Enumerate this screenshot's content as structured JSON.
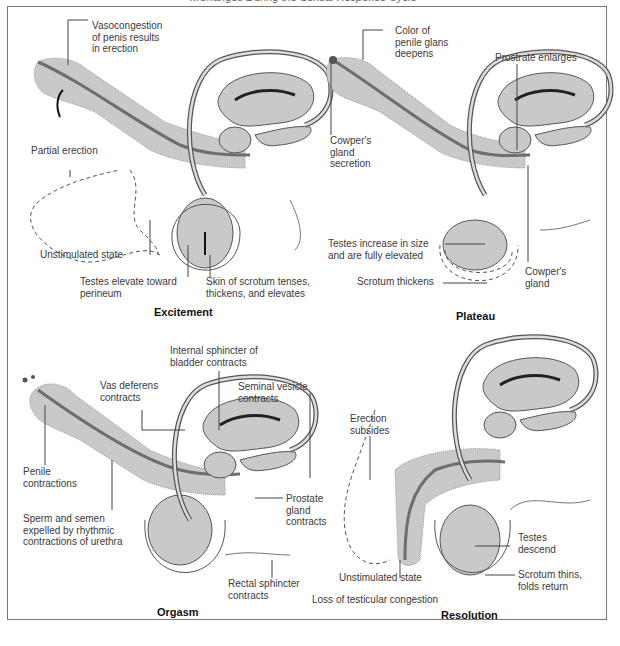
{
  "header": {
    "caption": "...Changes During the Sexual Response Cycle"
  },
  "panels": {
    "excitement": {
      "title": "Excitement",
      "labels": {
        "vasocongestion": "Vasocongestion\nof penis results\nin erection",
        "partial_erection": "Partial erection",
        "unstimulated": "Unstimulated state",
        "testes_elevate": "Testes elevate toward\nperineum",
        "scrotum_tenses": "Skin of scrotum tenses,\nthickens, and elevates"
      }
    },
    "plateau": {
      "title": "Plateau",
      "labels": {
        "glans_color": "Color of\npenile glans\ndeepens",
        "prostate_enlarges": "Prostrate enlarges",
        "cowpers_secretion": "Cowper's\ngland\nsecretion",
        "testes_increase": "Testes increase in size\nand are fully elevated",
        "scrotum_thickens": "Scrotum thickens",
        "cowpers_gland": "Cowper's\ngland"
      }
    },
    "orgasm": {
      "title": "Orgasm",
      "labels": {
        "internal_sphincter": "Internal sphincter of\nbladder contracts",
        "vas_deferens": "Vas deferens\ncontracts",
        "seminal_vesicle": "Seminal vesicle\ncontracts",
        "penile_contractions": "Penile\ncontractions",
        "prostate_contracts": "Prostate\ngland\ncontracts",
        "sperm_semen": "Sperm and semen\nexpelled by rhythmic\ncontractions of urethra",
        "rectal_sphincter": "Rectal sphincter\ncontracts"
      }
    },
    "resolution": {
      "title": "Resolution",
      "labels": {
        "erection_subsides": "Erection\nsubsides",
        "testes_descend": "Testes\ndescend",
        "unstimulated": "Unstimulated state",
        "scrotum_thins": "Scrotum thins,\nfolds return",
        "loss_congestion": "Loss of testicular congestion"
      }
    }
  },
  "colors": {
    "tissue": "#c9c9c9",
    "urethra": "#6e6e6e",
    "line": "#444444",
    "border": "#777777"
  }
}
